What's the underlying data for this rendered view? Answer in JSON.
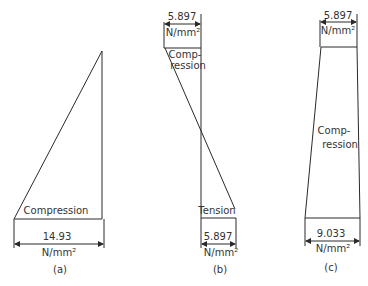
{
  "figure": {
    "panels": [
      {
        "id": "a",
        "caption": "(a)",
        "region_label": "Compression",
        "dimension_value": "14.93",
        "dimension_unit": "N/mm²"
      },
      {
        "id": "b",
        "caption": "(b)",
        "top_region_label_line1": "Comp-",
        "top_region_label_line2": "ression",
        "top_dimension_value": "5.897",
        "top_dimension_unit": "N/mm²",
        "bottom_region_label": "Tension",
        "bottom_dimension_value": "5.897",
        "bottom_dimension_unit": "N/mm²"
      },
      {
        "id": "c",
        "caption": "(c)",
        "region_label_line1": "Comp-",
        "region_label_line2": "ression",
        "top_dimension_value": "5.897",
        "top_dimension_unit": "N/mm²",
        "bottom_dimension_value": "9.033",
        "bottom_dimension_unit": "N/mm²"
      }
    ]
  }
}
